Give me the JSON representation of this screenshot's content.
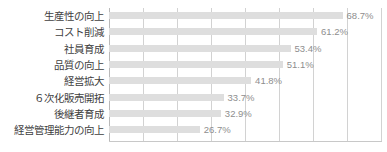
{
  "chart_data": {
    "type": "bar",
    "orientation": "horizontal",
    "title": "",
    "subtitle": "",
    "xlabel": "",
    "ylabel": "",
    "xlim": [
      0,
      80
    ],
    "grid": true,
    "gridline_interval": 10,
    "gridline_values": [
      0,
      10,
      20,
      30,
      40,
      50,
      60,
      70,
      80
    ],
    "legend": false,
    "legend_position": "none",
    "value_suffix": "%",
    "categories": [
      "生産性の向上",
      "コスト削減",
      "社員育成",
      "品質の向上",
      "経営拡大",
      "６次化販売開拓",
      "後継者育成",
      "経営管理能力の向上"
    ],
    "values": [
      68.7,
      61.2,
      53.4,
      51.1,
      41.8,
      33.7,
      32.9,
      26.7
    ],
    "value_labels": [
      "68.7%",
      "61.2%",
      "53.4%",
      "51.1%",
      "41.8%",
      "33.7%",
      "32.9%",
      "26.7%"
    ],
    "colors": {
      "bar": "#dedede",
      "gridline": "#d2d2d2",
      "axis": "#b9b9b9",
      "category_text": "#3f3f3f",
      "value_text": "#8e8e8e",
      "background": "#ffffff"
    }
  }
}
